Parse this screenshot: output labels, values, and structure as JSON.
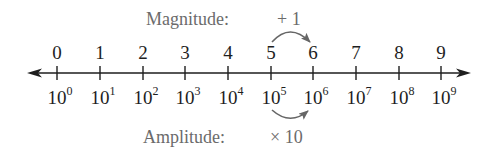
{
  "diagram": {
    "title_top": "Magnitude:",
    "title_bottom": "Amplitude:",
    "magnitude_operation": "+ 1",
    "amplitude_operation": "× 10",
    "colors": {
      "axis": "#1e1e1e",
      "labels": "#1e1e1e",
      "annotation": "#6b6b6b"
    },
    "number_line": {
      "ticks": [
        {
          "top": "0",
          "base": "10",
          "exp": "0"
        },
        {
          "top": "1",
          "base": "10",
          "exp": "1"
        },
        {
          "top": "2",
          "base": "10",
          "exp": "2"
        },
        {
          "top": "3",
          "base": "10",
          "exp": "3"
        },
        {
          "top": "4",
          "base": "10",
          "exp": "4"
        },
        {
          "top": "5",
          "base": "10",
          "exp": "5"
        },
        {
          "top": "6",
          "base": "10",
          "exp": "6"
        },
        {
          "top": "7",
          "base": "10",
          "exp": "7"
        },
        {
          "top": "8",
          "base": "10",
          "exp": "8"
        },
        {
          "top": "9",
          "base": "10",
          "exp": "9"
        }
      ]
    },
    "arrows": {
      "magnitude_from": "5",
      "magnitude_to": "6",
      "amplitude_from": "10^5",
      "amplitude_to": "10^6"
    }
  }
}
